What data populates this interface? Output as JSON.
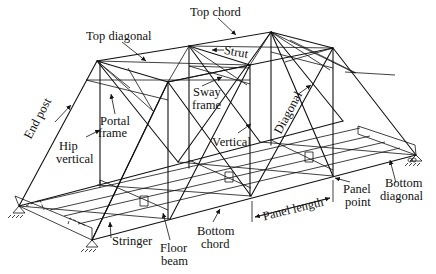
{
  "figure": {
    "type": "through truss bridge isometric diagram",
    "labels": {
      "top_chord": "Top chord",
      "top_diagonal": "Top diagonal",
      "strut": "Strut",
      "sway_frame_1": "Sway",
      "sway_frame_2": "frame",
      "portal_frame_1": "Portal",
      "portal_frame_2": "frame",
      "end_post": "End post",
      "hip_vertical_1": "Hip",
      "hip_vertical_2": "vertical",
      "vertical": "Vertical",
      "diagonal": "Diagonal",
      "panel_length": "Panel length",
      "panel_point_1": "Panel",
      "panel_point_2": "point",
      "bottom_diagonal_1": "Bottom",
      "bottom_diagonal_2": "diagonal",
      "bottom_chord_1": "Bottom",
      "bottom_chord_2": "chord",
      "floor_beam_1": "Floor",
      "floor_beam_2": "beam",
      "stringer": "Stringer"
    },
    "colors": {
      "line": "#111111",
      "background": "#ffffff"
    }
  }
}
